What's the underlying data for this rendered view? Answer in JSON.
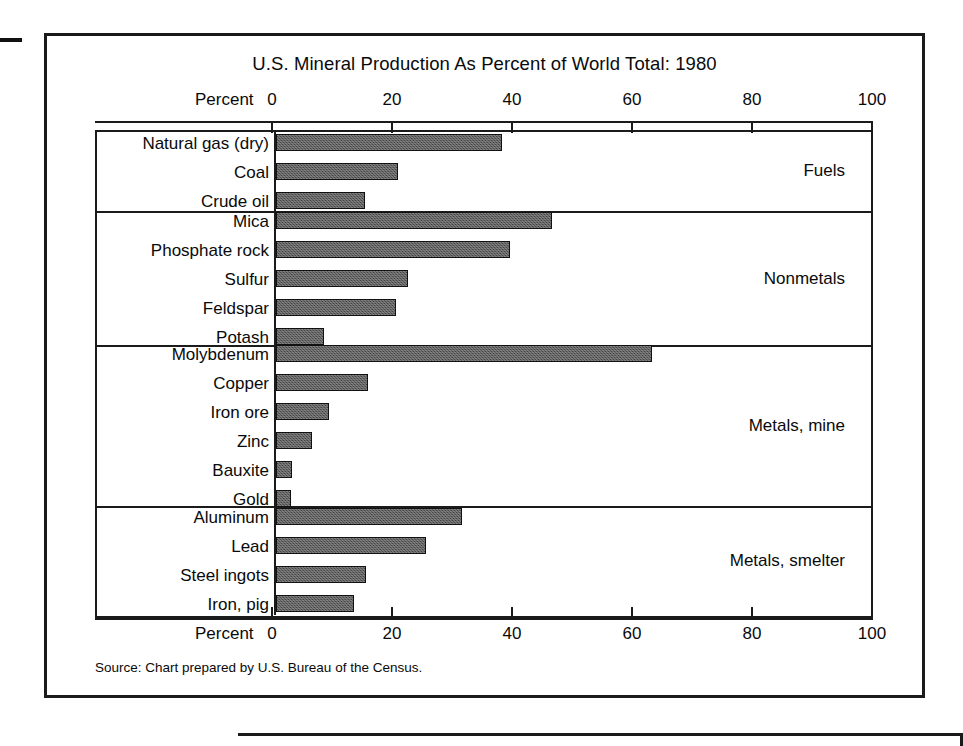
{
  "figure": {
    "title": "U.S. Mineral Production As Percent of World Total: 1980",
    "axis_label_top": "Percent",
    "axis_label_bottom": "Percent",
    "source_note": "Source: Chart prepared by U.S. Bureau of the Census."
  },
  "chart_data": {
    "type": "bar",
    "orientation": "horizontal",
    "title": "U.S. Mineral Production As Percent of World Total: 1980",
    "xlabel": "Percent",
    "ylabel": "",
    "xlim": [
      0,
      100
    ],
    "xticks": [
      0,
      20,
      40,
      60,
      80,
      100
    ],
    "xtick_labels": [
      "0",
      "20",
      "40",
      "60",
      "80",
      "100"
    ],
    "grid": false,
    "legend": "none",
    "units": "percent of world total",
    "year": 1980,
    "groups": [
      {
        "name": "Fuels",
        "categories": [
          "Natural gas (dry)",
          "Coal",
          "Crude oil"
        ],
        "values": [
          37.7,
          20.3,
          14.8
        ]
      },
      {
        "name": "Nonmetals",
        "categories": [
          "Mica",
          "Phosphate rock",
          "Sulfur",
          "Feldspar",
          "Potash"
        ],
        "values": [
          46.0,
          39.0,
          22.0,
          20.0,
          8.0
        ]
      },
      {
        "name": "Metals, mine",
        "categories": [
          "Molybdenum",
          "Copper",
          "Iron ore",
          "Zinc",
          "Bauxite",
          "Gold"
        ],
        "values": [
          62.7,
          15.3,
          8.8,
          6.0,
          2.7,
          2.5
        ]
      },
      {
        "name": "Metals, smelter",
        "categories": [
          "Aluminum",
          "Lead",
          "Steel ingots",
          "Iron, pig"
        ],
        "values": [
          31.0,
          25.0,
          15.0,
          13.0
        ]
      }
    ],
    "colors": {
      "bar_fill": "#5c5c5c",
      "bar_outline": "#111111",
      "frame": "#1b1b1b",
      "background": "#ffffff"
    }
  }
}
